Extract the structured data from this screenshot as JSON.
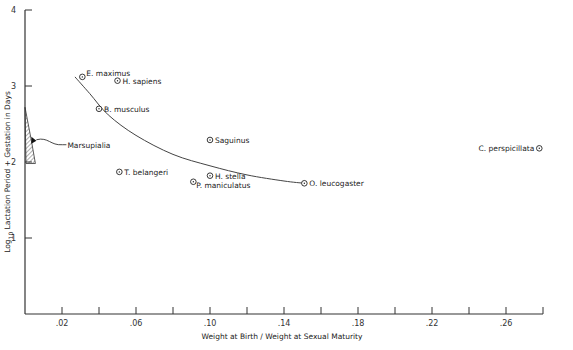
{
  "chart_data": {
    "type": "scatter",
    "title": "",
    "xlabel": "Weight at Birth / Weight at Sexual Maturity",
    "ylabel": "Log10 Lactation Period + Gestation in Days",
    "ylabel_parts": {
      "log": "Log",
      "sub": "10",
      "rest": " Lactation Period + Gestation in Days"
    },
    "xlim": [
      0,
      0.28
    ],
    "ylim": [
      0,
      4
    ],
    "x_ticks": [
      0.02,
      0.04,
      0.06,
      0.08,
      0.1,
      0.12,
      0.14,
      0.16,
      0.18,
      0.2,
      0.22,
      0.24,
      0.26,
      0.28
    ],
    "x_tick_labels": [
      ".02",
      "",
      ".06",
      "",
      ".10",
      "",
      ".14",
      "",
      ".18",
      "",
      ".22",
      "",
      ".26",
      ""
    ],
    "y_ticks": [
      1,
      2,
      3,
      4
    ],
    "y_tick_labels": [
      "1",
      "2",
      "3",
      "4"
    ],
    "grid": false,
    "legend": null,
    "points": [
      {
        "label": "E. maximus",
        "x": 0.031,
        "y": 3.12,
        "label_pos": "right-up"
      },
      {
        "label": "H. sapiens",
        "x": 0.05,
        "y": 3.07,
        "label_pos": "right"
      },
      {
        "label": "B. musculus",
        "x": 0.04,
        "y": 2.7,
        "label_pos": "right"
      },
      {
        "label": "Saguinus",
        "x": 0.1,
        "y": 2.29,
        "label_pos": "right"
      },
      {
        "label": "T. belangeri",
        "x": 0.051,
        "y": 1.87,
        "label_pos": "right"
      },
      {
        "label": "H. stella",
        "x": 0.1,
        "y": 1.82,
        "label_pos": "right"
      },
      {
        "label": "P. maniculatus",
        "x": 0.091,
        "y": 1.74,
        "label_pos": "right-down"
      },
      {
        "label": "O. leucogaster",
        "x": 0.151,
        "y": 1.72,
        "label_pos": "right"
      },
      {
        "label": "C. perspicillata",
        "x": 0.278,
        "y": 2.18,
        "label_pos": "left"
      }
    ],
    "fit_curve": {
      "description": "Hand-drawn decreasing curve through the data",
      "points": [
        [
          0.027,
          3.12
        ],
        [
          0.035,
          2.9
        ],
        [
          0.045,
          2.62
        ],
        [
          0.06,
          2.35
        ],
        [
          0.08,
          2.1
        ],
        [
          0.1,
          1.95
        ],
        [
          0.12,
          1.83
        ],
        [
          0.14,
          1.75
        ],
        [
          0.151,
          1.72
        ]
      ]
    },
    "annotation": {
      "label": "Marsupialia",
      "x_range": [
        0.0,
        0.004
      ],
      "y_range": [
        1.98,
        2.72
      ],
      "marker_y": 2.28,
      "style": "hatched wedge"
    }
  }
}
